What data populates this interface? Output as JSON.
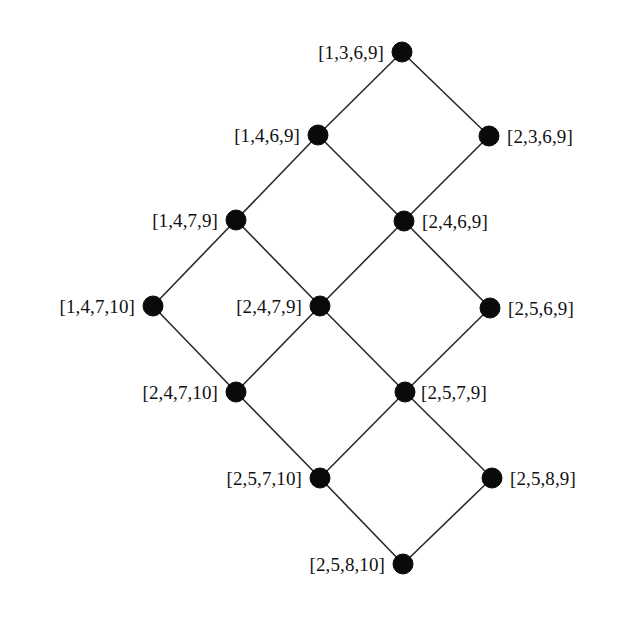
{
  "diagram": {
    "type": "hasse-lattice",
    "title": "",
    "background_color": "#ffffff",
    "node_color": "#0a0a0a",
    "edge_color": "#2b2b2b",
    "label_color": "#111111",
    "node_radius": 10,
    "nodes": [
      {
        "id": "n0",
        "label": "[1,3,6,9]",
        "x": 402,
        "y": 52,
        "label_side": "left",
        "label_gap": 18
      },
      {
        "id": "n1",
        "label": "[1,4,6,9]",
        "x": 318,
        "y": 135,
        "label_side": "left",
        "label_gap": 18
      },
      {
        "id": "n2",
        "label": "[2,3,6,9]",
        "x": 489,
        "y": 136,
        "label_side": "right",
        "label_gap": 18
      },
      {
        "id": "n3",
        "label": "[1,4,7,9]",
        "x": 236,
        "y": 220,
        "label_side": "left",
        "label_gap": 18
      },
      {
        "id": "n4",
        "label": "[2,4,6,9]",
        "x": 404,
        "y": 221,
        "label_side": "right",
        "label_gap": 18
      },
      {
        "id": "n5",
        "label": "[1,4,7,10]",
        "x": 153,
        "y": 306,
        "label_side": "left",
        "label_gap": 18
      },
      {
        "id": "n6",
        "label": "[2,4,7,9]",
        "x": 320,
        "y": 306,
        "label_side": "left",
        "label_gap": 18
      },
      {
        "id": "n7",
        "label": "[2,5,6,9]",
        "x": 490,
        "y": 308,
        "label_side": "right",
        "label_gap": 18
      },
      {
        "id": "n8",
        "label": "[2,4,7,10]",
        "x": 236,
        "y": 392,
        "label_side": "left",
        "label_gap": 18
      },
      {
        "id": "n9",
        "label": "[2,5,7,9]",
        "x": 405,
        "y": 392,
        "label_side": "right",
        "label_gap": 16
      },
      {
        "id": "n10",
        "label": "[2,5,7,10]",
        "x": 320,
        "y": 478,
        "label_side": "left",
        "label_gap": 18
      },
      {
        "id": "n11",
        "label": "[2,5,8,9]",
        "x": 492,
        "y": 478,
        "label_side": "right",
        "label_gap": 18
      },
      {
        "id": "n12",
        "label": "[2,5,8,10]",
        "x": 403,
        "y": 564,
        "label_side": "left",
        "label_gap": 18
      }
    ],
    "edges": [
      {
        "from": "n0",
        "to": "n1"
      },
      {
        "from": "n0",
        "to": "n2"
      },
      {
        "from": "n1",
        "to": "n3"
      },
      {
        "from": "n1",
        "to": "n4"
      },
      {
        "from": "n2",
        "to": "n4"
      },
      {
        "from": "n3",
        "to": "n5"
      },
      {
        "from": "n3",
        "to": "n6"
      },
      {
        "from": "n4",
        "to": "n6"
      },
      {
        "from": "n4",
        "to": "n7"
      },
      {
        "from": "n5",
        "to": "n8"
      },
      {
        "from": "n6",
        "to": "n8"
      },
      {
        "from": "n6",
        "to": "n9"
      },
      {
        "from": "n7",
        "to": "n9"
      },
      {
        "from": "n8",
        "to": "n10"
      },
      {
        "from": "n9",
        "to": "n10"
      },
      {
        "from": "n9",
        "to": "n11"
      },
      {
        "from": "n10",
        "to": "n12"
      },
      {
        "from": "n11",
        "to": "n12"
      }
    ]
  }
}
